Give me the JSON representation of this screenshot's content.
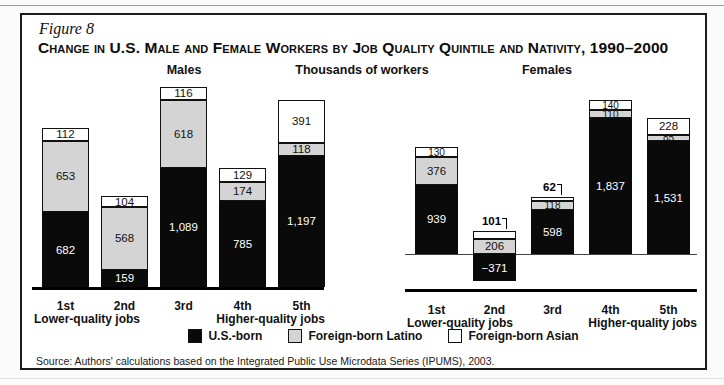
{
  "figure_label": "Figure 8",
  "title": "Change in U.S. Male and Female Workers by Job Quality Quintile and Nativity, 1990–2000",
  "center_axis_label": "Thousands of workers",
  "source": "Source: Authors' calculations based on the Integrated Public Use Microdata Series (IPUMS), 2003.",
  "legend": [
    {
      "label": "U.S.-born",
      "color": "#0a0a0a"
    },
    {
      "label": "Foreign-born Latino",
      "color": "#d4d4d4"
    },
    {
      "label": "Foreign-born Asian",
      "color": "#ffffff"
    }
  ],
  "x_axis": {
    "categories": [
      "1st",
      "2nd",
      "3rd",
      "4th",
      "5th"
    ],
    "left_note": "Lower-quality jobs",
    "right_note": "Higher-quality jobs"
  },
  "chart_data": [
    {
      "type": "bar",
      "stacked": true,
      "panel": "Males",
      "ylabel": "Thousands of workers",
      "categories": [
        "1st",
        "2nd",
        "3rd",
        "4th",
        "5th"
      ],
      "series": [
        {
          "name": "U.S.-born",
          "values": [
            682,
            159,
            1089,
            785,
            1197
          ]
        },
        {
          "name": "Foreign-born Latino",
          "values": [
            653,
            568,
            618,
            174,
            118
          ]
        },
        {
          "name": "Foreign-born Asian",
          "values": [
            112,
            104,
            116,
            129,
            391
          ]
        }
      ],
      "outside_labels": []
    },
    {
      "type": "bar",
      "stacked": true,
      "panel": "Females",
      "ylabel": "Thousands of workers",
      "categories": [
        "1st",
        "2nd",
        "3rd",
        "4th",
        "5th"
      ],
      "series": [
        {
          "name": "U.S.-born",
          "values": [
            939,
            -371,
            598,
            1837,
            1531
          ]
        },
        {
          "name": "Foreign-born Latino",
          "values": [
            376,
            206,
            118,
            110,
            85
          ]
        },
        {
          "name": "Foreign-born Asian",
          "values": [
            130,
            101,
            62,
            140,
            228
          ]
        }
      ],
      "outside_labels": [
        {
          "category": "2nd",
          "series": "Foreign-born Asian"
        },
        {
          "category": "3rd",
          "series": "Foreign-born Asian"
        }
      ]
    }
  ]
}
